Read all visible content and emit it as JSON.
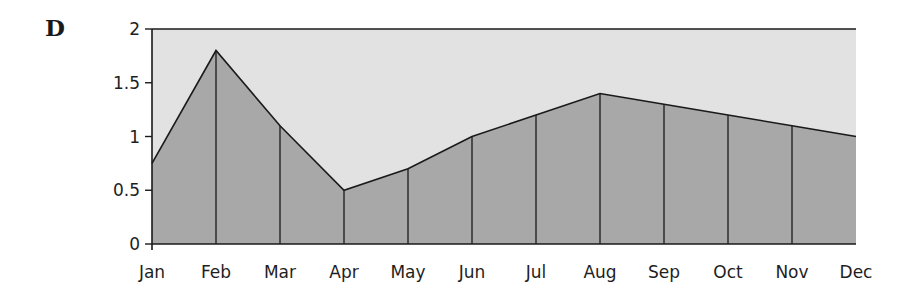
{
  "panel_label": "D",
  "colors": {
    "plot_background": "#e2e2e2",
    "area_fill": "#a8a8a8",
    "line": "#1a1a1a"
  },
  "chart_data": {
    "type": "area",
    "title": "D",
    "xlabel": "",
    "ylabel": "",
    "categories": [
      "Jan",
      "Feb",
      "Mar",
      "Apr",
      "May",
      "Jun",
      "Jul",
      "Aug",
      "Sep",
      "Oct",
      "Nov",
      "Dec"
    ],
    "values": [
      0.75,
      1.8,
      1.1,
      0.5,
      0.7,
      1.0,
      1.2,
      1.4,
      1.3,
      1.2,
      1.1,
      1.0
    ],
    "ylim": [
      0,
      2
    ],
    "yticks": [
      0,
      0.5,
      1,
      1.5,
      2
    ],
    "ytick_labels": [
      "0",
      "0.5",
      "1",
      "1.5",
      "2"
    ],
    "grid": false,
    "vertical_drop_lines": true,
    "legend": null
  }
}
